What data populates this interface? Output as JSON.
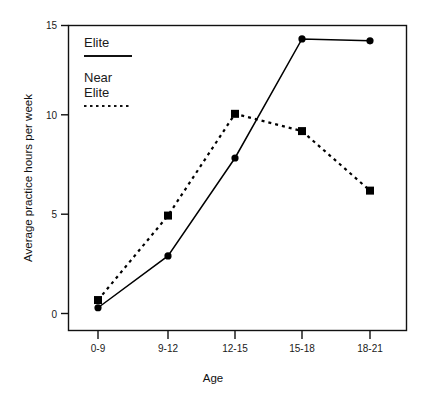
{
  "chart_data": {
    "type": "line",
    "title": "",
    "xlabel": "Age",
    "ylabel": "Average practice hours per week",
    "categories": [
      "0-9",
      "9-12",
      "12-15",
      "15-18",
      "18-21"
    ],
    "ylim": [
      0,
      15
    ],
    "yticks": [
      0,
      5,
      10,
      15
    ],
    "ytick_labels": [
      "0",
      "5",
      "10",
      "15"
    ],
    "grid": false,
    "legend_position": "top-left inside plot area",
    "series": [
      {
        "name": "Elite",
        "line_style": "solid",
        "marker": "circle",
        "color": "#000000",
        "values": [
          0.3,
          3.0,
          8.1,
          14.3,
          14.2
        ]
      },
      {
        "name": "Near Elite",
        "line_style": "dotted",
        "marker": "square",
        "color": "#000000",
        "values": [
          0.7,
          5.1,
          10.4,
          9.5,
          6.4
        ]
      }
    ]
  },
  "legend": {
    "entries": [
      {
        "label": "Elite",
        "style": "solid"
      },
      {
        "label_line1": "Near",
        "label_line2": "Elite",
        "style": "dotted"
      }
    ]
  },
  "axes": {
    "y_title": "Average practice hours per week",
    "x_title": "Age",
    "y_tick_0": "0",
    "y_tick_5": "5",
    "y_tick_10": "10",
    "y_tick_15": "15",
    "x_tick_0": "0-9",
    "x_tick_1": "9-12",
    "x_tick_2": "12-15",
    "x_tick_3": "15-18",
    "x_tick_4": "18-21"
  }
}
